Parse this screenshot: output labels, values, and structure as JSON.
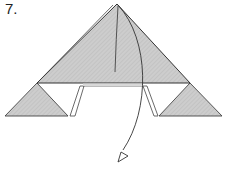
{
  "step": {
    "label": "7."
  },
  "diagram": {
    "colors": {
      "paper_fill": "#c8c8c8",
      "hatch": "#b4b4b4",
      "outline": "#333333",
      "background": "#ffffff"
    },
    "elements": [
      "large-top-triangle",
      "left-small-triangle",
      "right-small-triangle",
      "left-flap-strip",
      "right-flap-strip",
      "center-crease-line",
      "fold-arrow"
    ]
  }
}
